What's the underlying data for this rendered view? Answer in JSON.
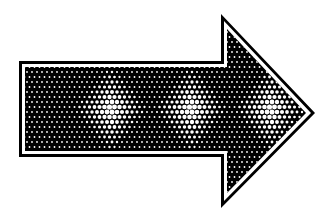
{
  "figure": {
    "direction": "right",
    "colors": {
      "background": "#ffffff",
      "ink": "#000000",
      "gap": "#ffffff"
    },
    "geometry": {
      "outer": [
        [
          19,
          61
        ],
        [
          221,
          61
        ],
        [
          221,
          14
        ],
        [
          315,
          113
        ],
        [
          221,
          208
        ],
        [
          221,
          157
        ],
        [
          19,
          157
        ]
      ],
      "inner": [
        [
          25,
          67
        ],
        [
          227,
          67
        ],
        [
          227,
          29
        ],
        [
          306,
          113
        ],
        [
          227,
          193
        ],
        [
          227,
          151
        ],
        [
          25,
          151
        ]
      ]
    },
    "pattern": {
      "type": "warped-checkerboard",
      "cell": 5,
      "bulge_centers_x": [
        111,
        191,
        271
      ],
      "pinch_centers_x": [
        71,
        151,
        231
      ],
      "center_y": 109
    }
  }
}
